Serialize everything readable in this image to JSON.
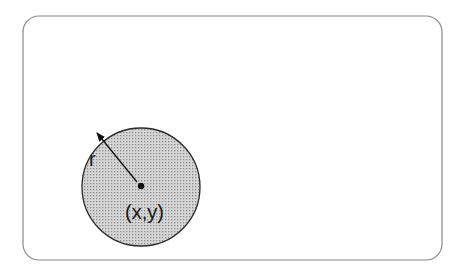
{
  "diagram": {
    "type": "geometry",
    "frame": {
      "shape": "rounded-rectangle",
      "x": 23,
      "y": 16,
      "width": 419,
      "height": 244,
      "corner_radius": 16,
      "stroke": "#8a8a8a"
    },
    "circle": {
      "cx": 141,
      "cy": 187,
      "r": 59,
      "fill": "stippled-gray",
      "stroke": "#2a2a2a"
    },
    "center_point": {
      "cx": 141,
      "cy": 186
    },
    "radius_arrow": {
      "x1": 97,
      "y1": 133,
      "x2": 139,
      "y2": 184,
      "double_headed": true
    },
    "labels": {
      "radius": "r",
      "center": "(x,y)"
    }
  }
}
